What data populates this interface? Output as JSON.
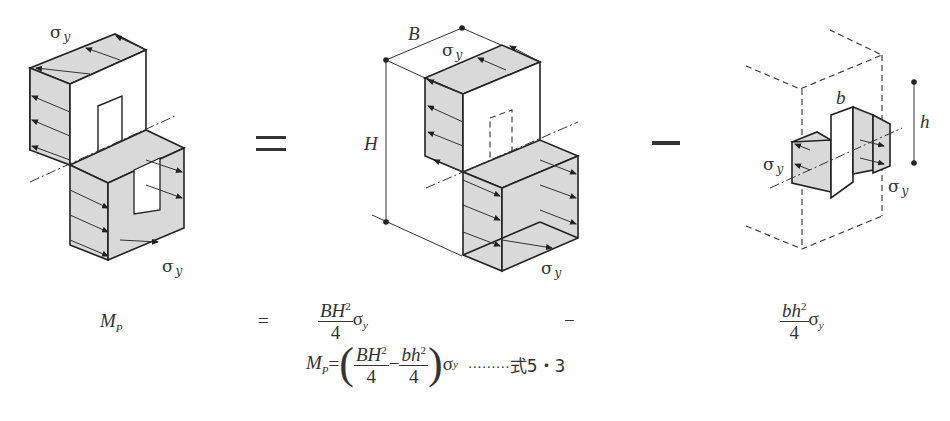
{
  "figure": {
    "labels": {
      "sigma_y": "σ",
      "sigma_sub": "y",
      "B": "B",
      "H": "H",
      "b": "b",
      "h": "h"
    },
    "operators": {
      "equals_big": "=",
      "minus_big": "−"
    }
  },
  "captions": {
    "left": {
      "M": "M",
      "sub": "P"
    },
    "equals": "=",
    "middle": {
      "num": "BH",
      "exp": "2",
      "den": "4",
      "sigma": "σ",
      "sub": "y"
    },
    "minus": "−",
    "right": {
      "num": "bh",
      "exp": "2",
      "den": "4",
      "sigma": "σ",
      "sub": "y"
    }
  },
  "formula": {
    "M": "M",
    "sub": "P",
    "eq": "=",
    "lparen": "(",
    "t1_num": "BH",
    "t1_exp": "2",
    "t1_den": "4",
    "minus": "−",
    "t2_num": "bh",
    "t2_exp": "2",
    "t2_den": "4",
    "rparen": ")",
    "sigma": "σ",
    "sigma_sub": "y",
    "leader": "………",
    "ref": "式5・3"
  }
}
